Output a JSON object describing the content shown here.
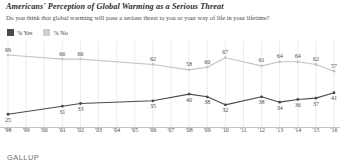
{
  "header": {
    "title": "Americans' Perception of Global Warming as a Serious Threat",
    "subtitle": "Do you think that global warming will pose a serious threat to you or your way of life in your lifetime?"
  },
  "legend": {
    "position": "top-left",
    "items": [
      {
        "label": "% Yes",
        "color": "#4b4b4b",
        "swatch": "yes"
      },
      {
        "label": "% No",
        "color": "#cfcfcf",
        "swatch": "no"
      }
    ]
  },
  "footer": {
    "brand": "GALLUP"
  },
  "colors": {
    "yes_line": "#4b4b4b",
    "no_line": "#c4c4c4",
    "gridline": "#e2e2e2",
    "axis": "#b5b5b5",
    "label_text": "#4a4a4a"
  },
  "chart_data": {
    "type": "line",
    "title": "Americans' Perception of Global Warming as a Serious Threat",
    "subtitle": "Do you think that global warming will pose a serious threat to you or your way of life in your lifetime?",
    "xlabel": "",
    "ylabel": "",
    "ylim": [
      20,
      75
    ],
    "grid": true,
    "legend_position": "top-left",
    "source": "GALLUP",
    "x": [
      "'98",
      "'99",
      "'00",
      "'01",
      "'02",
      "'03",
      "'04",
      "'05",
      "'06",
      "'07",
      "'08",
      "'09",
      "'10",
      "'11",
      "'12",
      "'13",
      "'14",
      "'15",
      "'16"
    ],
    "tick_labels": [
      "'98",
      "'99",
      "'00",
      "'01",
      "'02",
      "'03",
      "'04",
      "'05",
      "'06",
      "'07",
      "'08",
      "'09",
      "'10",
      "'11",
      "'12",
      "'13",
      "'14",
      "'15",
      "'16"
    ],
    "series": [
      {
        "name": "% Yes",
        "color": "#4b4b4b",
        "points": [
          {
            "x": "'98",
            "y": 25,
            "label": "25",
            "has_marker": true
          },
          {
            "x": "'01",
            "y": 31,
            "label": "31",
            "has_marker": true
          },
          {
            "x": "'02",
            "y": 33,
            "label": "33",
            "has_marker": true
          },
          {
            "x": "'06",
            "y": 35,
            "label": "35",
            "has_marker": true
          },
          {
            "x": "'08",
            "y": 40,
            "label": "40",
            "has_marker": true
          },
          {
            "x": "'09",
            "y": 38,
            "label": "38",
            "has_marker": true
          },
          {
            "x": "'10",
            "y": 32,
            "label": "32",
            "has_marker": true
          },
          {
            "x": "'12",
            "y": 38,
            "label": "38",
            "has_marker": true
          },
          {
            "x": "'13",
            "y": 34,
            "label": "34",
            "has_marker": true
          },
          {
            "x": "'14",
            "y": 36,
            "label": "36",
            "has_marker": true
          },
          {
            "x": "'15",
            "y": 37,
            "label": "37",
            "has_marker": true
          },
          {
            "x": "'16",
            "y": 41,
            "label": "41",
            "has_marker": true
          }
        ]
      },
      {
        "name": "% No",
        "color": "#c4c4c4",
        "points": [
          {
            "x": "'98",
            "y": 69,
            "label": "69",
            "has_marker": true
          },
          {
            "x": "'01",
            "y": 66,
            "label": "66",
            "has_marker": true
          },
          {
            "x": "'02",
            "y": 66,
            "label": "66",
            "has_marker": true
          },
          {
            "x": "'06",
            "y": 62,
            "label": "62",
            "has_marker": true
          },
          {
            "x": "'08",
            "y": 58,
            "label": "58",
            "has_marker": true
          },
          {
            "x": "'09",
            "y": 60,
            "label": "60",
            "has_marker": true
          },
          {
            "x": "'10",
            "y": 67,
            "label": "67",
            "has_marker": true
          },
          {
            "x": "'12",
            "y": 61,
            "label": "61",
            "has_marker": true
          },
          {
            "x": "'13",
            "y": 64,
            "label": "64",
            "has_marker": true
          },
          {
            "x": "'14",
            "y": 64,
            "label": "64",
            "has_marker": true
          },
          {
            "x": "'15",
            "y": 62,
            "label": "62",
            "has_marker": true
          },
          {
            "x": "'16",
            "y": 57,
            "label": "57",
            "has_marker": true
          }
        ]
      }
    ]
  }
}
